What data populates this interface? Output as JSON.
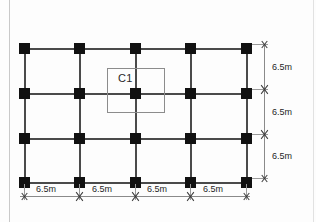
{
  "diagram": {
    "callout": {
      "label": "C1",
      "target_grid": "row-2-col-3"
    },
    "grid": {
      "columns_x": [
        20,
        75,
        131,
        186,
        242
      ],
      "rows_y": [
        44,
        89,
        134,
        178
      ],
      "column_marker_size": 11,
      "column_color": "#111111",
      "beam_color": "#4a4a4a",
      "background_color": "#fdfdfd"
    },
    "horizontal_dimensions": {
      "labels": [
        "6.5m",
        "6.5m",
        "6.5m",
        "6.5m"
      ],
      "count": 4,
      "total": "26.0m"
    },
    "vertical_dimensions": {
      "labels": [
        "6.5m",
        "6.5m",
        "6.5m"
      ],
      "count": 3,
      "total": "19.5m"
    }
  }
}
